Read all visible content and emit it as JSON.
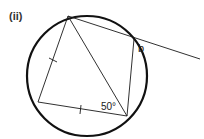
{
  "figure": {
    "part_label": "(ii)",
    "angle_label": "50°",
    "unknown_label": "b",
    "colors": {
      "stroke": "#1a1a1a",
      "circle": "#111111",
      "background": "#ffffff"
    }
  },
  "geometry": {
    "circle": {
      "cx": 87,
      "cy": 76,
      "r": 60
    },
    "points": {
      "A": [
        68,
        16
      ],
      "B": [
        134,
        39
      ],
      "C": [
        127,
        116
      ],
      "D": [
        38,
        102
      ],
      "E": [
        200,
        59
      ]
    },
    "segments": [
      "AB",
      "BE",
      "AD",
      "DC",
      "AC",
      "BC"
    ],
    "equal_marks": [
      "AD",
      "DC"
    ],
    "angle_marked": {
      "at": "C",
      "value": "50°"
    },
    "exterior_angle": {
      "at": "B",
      "label": "b"
    }
  }
}
